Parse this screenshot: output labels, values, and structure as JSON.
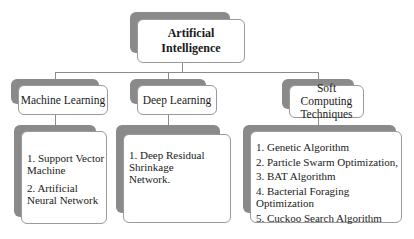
{
  "root": {
    "label": "Artificial Intelligence"
  },
  "branches": [
    {
      "label": "Machine Learning",
      "items": [
        "1. Support Vector Machine",
        "2. Artificial Neural Network"
      ]
    },
    {
      "label": "Deep Learning",
      "items": [
        "1. Deep Residual Shrinkage Network."
      ]
    },
    {
      "label": "Soft Computing Techniques",
      "items": [
        "1. Genetic Algorithm",
        "2. Particle Swarm Optimization,",
        "3. BAT Algorithm",
        "4. Bacterial Foraging Optimization",
        "5. Cuckoo Search Algorithm"
      ]
    }
  ],
  "colors": {
    "shadow": "#8a8a8a",
    "border": "#9a9a9a",
    "line": "#8c8c8c",
    "background": "#ffffff"
  }
}
